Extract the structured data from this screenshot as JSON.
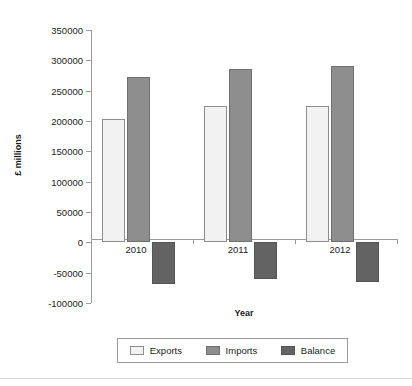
{
  "chart_data": {
    "type": "bar",
    "title": "",
    "xlabel": "Year",
    "ylabel": "£ millions",
    "categories": [
      "2010",
      "2011",
      "2012"
    ],
    "series": [
      {
        "name": "Exports",
        "values": [
          203000,
          224000,
          225000
        ],
        "color": "#f2f2f2"
      },
      {
        "name": "Imports",
        "values": [
          272000,
          285000,
          291000
        ],
        "color": "#8e8e8e"
      },
      {
        "name": "Balance",
        "values": [
          -69000,
          -60000,
          -66000
        ],
        "color": "#636363"
      }
    ],
    "ylim": [
      -100000,
      350000
    ],
    "ytick_step": 50000,
    "yticks": [
      350000,
      300000,
      250000,
      200000,
      150000,
      100000,
      50000,
      0,
      -50000,
      -100000
    ],
    "ytick_labels": [
      "350000",
      "300000",
      "250000",
      "200000",
      "150000",
      "100000",
      "50000",
      "0",
      "-50000",
      "-100000"
    ],
    "grid": false,
    "legend_position": "bottom",
    "zero_line": true
  },
  "axis": {
    "y_title": "£ millions",
    "x_title": "Year"
  },
  "legend": {
    "items": [
      {
        "label": "Exports"
      },
      {
        "label": "Imports"
      },
      {
        "label": "Balance"
      }
    ]
  }
}
